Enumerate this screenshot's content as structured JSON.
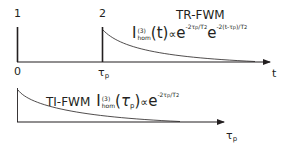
{
  "diagram": {
    "top_panel": {
      "title": "TR-FWM",
      "pulse_labels": [
        "1",
        "2"
      ],
      "axis_label": "t",
      "tick_labels": [
        "0",
        "τ",
        "p"
      ],
      "formula": {
        "intensity": "I",
        "order": "(3)",
        "subscript": "hom",
        "argument": "t",
        "proportional": "∝",
        "exp_base": "e",
        "exp1": "-2τ",
        "exp1_sub": "p",
        "exp1_tail": "/T",
        "exp1_tail_sub": "2",
        "exp2": "-2(t-τ",
        "exp2_sub": "p",
        "exp2_tail": ")/T",
        "exp2_tail_sub": "2"
      }
    },
    "bottom_panel": {
      "title": "TI-FWM",
      "axis_label": "τ",
      "axis_label_sub": "p",
      "formula": {
        "intensity": "I",
        "order": "(3)",
        "subscript": "hom",
        "argument": "τ",
        "argument_sub": "p",
        "proportional": "∝",
        "exp_base": "e",
        "exp1": "-2τ",
        "exp1_sub": "p",
        "exp1_tail": "/T",
        "exp1_tail_sub": "2"
      }
    },
    "colors": {
      "ink": "#231f20"
    }
  }
}
